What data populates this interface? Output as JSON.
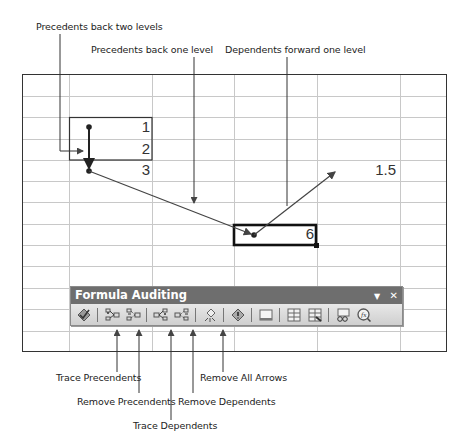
{
  "callouts": {
    "precedents_two": "Precedents back two levels",
    "precedents_one": "Precedents back one level",
    "dependents_one": "Dependents forward one level",
    "trace_precedents": "Trace Precendents",
    "remove_precedents": "Remove Precendents",
    "trace_dependents": "Trace Dependents",
    "remove_dependents": "Remove Dependents",
    "remove_all_arrows": "Remove All Arrows"
  },
  "cells": {
    "c1": "1",
    "c2": "2",
    "c3": "3",
    "selected": "6",
    "dependent": "1.5"
  },
  "toolbar": {
    "title": "Formula Auditing",
    "menu_glyph": "▼",
    "close_glyph": "✕",
    "buttons": [
      {
        "name": "error-checking",
        "icon": "error-check-icon"
      },
      {
        "name": "trace-precedents",
        "icon": "trace-precedents-icon"
      },
      {
        "name": "remove-precedent-arrows",
        "icon": "remove-precedents-icon"
      },
      {
        "name": "trace-dependents",
        "icon": "trace-dependents-icon"
      },
      {
        "name": "remove-dependent-arrows",
        "icon": "remove-dependents-icon"
      },
      {
        "name": "remove-all-arrows",
        "icon": "remove-all-arrows-icon"
      },
      {
        "name": "trace-error",
        "icon": "trace-error-icon"
      },
      {
        "name": "new-comment",
        "icon": "comment-icon"
      },
      {
        "name": "circle-invalid-data",
        "icon": "circle-invalid-icon"
      },
      {
        "name": "clear-validation-circles",
        "icon": "clear-circles-icon"
      },
      {
        "name": "show-watch-window",
        "icon": "watch-window-icon"
      },
      {
        "name": "evaluate-formula",
        "icon": "evaluate-formula-icon"
      }
    ]
  },
  "colors": {
    "title_bar": "#6e6e6e",
    "toolbar_bg": "#d6d6d6",
    "gridline": "#c8c8c8",
    "arrow": "#444444"
  }
}
